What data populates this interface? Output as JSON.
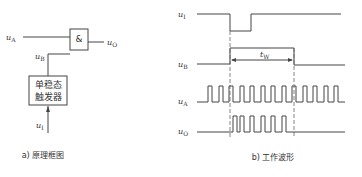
{
  "left_panel": {
    "gate_symbol": "&",
    "input_a_label": "u",
    "input_a_sub": "A",
    "input_b_label": "u",
    "input_b_sub": "B",
    "output_label": "u",
    "output_sub": "O",
    "trigger_input_label": "u",
    "trigger_input_sub": "I",
    "box_line1": "单稳态",
    "box_line2": "触发器",
    "caption": "a) 原理框图"
  },
  "right_panel": {
    "signals": [
      {
        "label": "u",
        "sub": "I"
      },
      {
        "label": "u",
        "sub": "B"
      },
      {
        "label": "u",
        "sub": "A"
      },
      {
        "label": "u",
        "sub": "O"
      }
    ],
    "pulse_width_label": "t",
    "pulse_width_sub": "W",
    "caption": "b) 工作波形"
  }
}
